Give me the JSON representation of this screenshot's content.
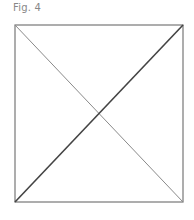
{
  "caption": "Fig. 4",
  "figure": {
    "shape": "square-with-diagonals",
    "box": {
      "x1": 15,
      "y1": 25,
      "x2": 183,
      "y2": 202
    },
    "colors": {
      "box_stroke": "#777777",
      "diagonal_primary": "#444444",
      "diagonal_secondary": "#8a8a8a"
    }
  }
}
